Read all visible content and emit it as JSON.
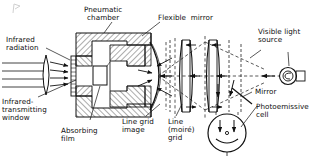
{
  "figure": {
    "type": "cross-section schematic diagram",
    "line_color": "#111111",
    "background_color": "#ffffff",
    "dashed_color": "#333333"
  },
  "labels": {
    "pneumatic_chamber": "Pneumatic\nchamber",
    "infrared_radiation": "Infrared\nradiation",
    "infrared_window": "Infrared-\ntransmitting\nwindow",
    "absorbing_film": "Absorbing\nfilm",
    "line_grid_image": "Line grid\nimage",
    "flexible_mirror": "Flexible  mirror",
    "visible_light_source": "Visible light\nsource",
    "mirror": "Mirror",
    "photoemissive_cell": "Photoemissive\ncell",
    "line_moire_grid": "Line\n(moiré)\ngrid"
  },
  "components": {
    "ir_lens": "infrared converging lens",
    "window": "infrared-transmitting window plate",
    "film": "absorbing film block",
    "chamber_body": "hatched pneumatic chamber body",
    "flexible_mirror_arc": "flexible curved mirror membrane",
    "lens_1": "biconvex relay lens 1",
    "lens_2": "biconvex relay lens 2",
    "grid_left": "line grid image plane",
    "grid_right": "line (moiré) grid plane",
    "lamp": "visible light source lamp",
    "mirror_flat": "flat turning mirror",
    "cell": "photoemissive cell envelope"
  },
  "ray_paths": {
    "infrared_rays_count": 4,
    "infrared_direction": "left-to-right into window",
    "visible_rays_direction": "right-to-left from lamp then down to cell",
    "visible_style": "dashed"
  }
}
